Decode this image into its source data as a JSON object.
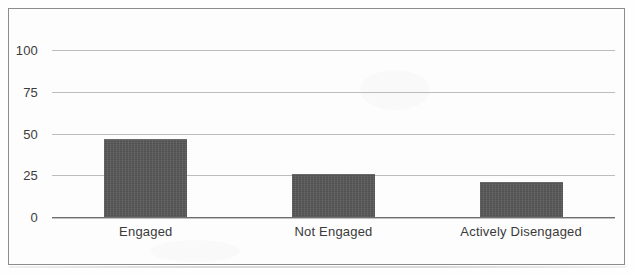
{
  "chart_data": {
    "type": "bar",
    "title": "",
    "subtitle": "",
    "xlabel": "",
    "ylabel": "",
    "categories": [
      "Engaged",
      "Not Engaged",
      "Actively Disengaged"
    ],
    "values": [
      47,
      26,
      21
    ],
    "series": [
      {
        "name": "Percentage of Employees",
        "values": [
          47,
          26,
          21
        ]
      }
    ],
    "ylim": [
      0,
      100
    ],
    "yticks": [
      0,
      25,
      50,
      75,
      100
    ],
    "ytick_labels": [
      "0",
      "25",
      "50",
      "75",
      "100"
    ],
    "grid": true,
    "grid_axis": "y",
    "legend": false,
    "legend_position": "none",
    "annotations": [],
    "bar_color": "#575757",
    "grid_color": "#bdbdbd",
    "axis_color": "#6f6f6f",
    "background_color": "#fdfdfd",
    "border_color": "#8c8c8c"
  },
  "figure": {
    "frame_visible": true,
    "width": 634,
    "height": 277
  }
}
